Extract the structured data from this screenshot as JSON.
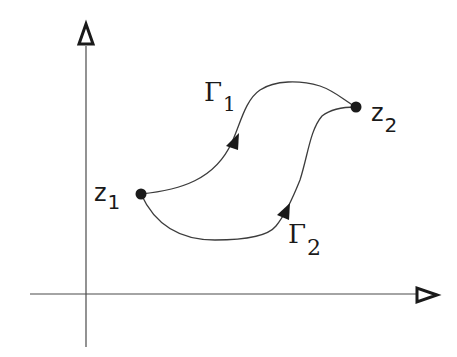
{
  "diagram": {
    "axes": {
      "x_axis": {
        "label": ""
      },
      "y_axis": {
        "label": ""
      }
    },
    "points": [
      {
        "id": "z1",
        "label_main": "z",
        "label_sub": "1"
      },
      {
        "id": "z2",
        "label_main": "z",
        "label_sub": "2"
      }
    ],
    "paths": [
      {
        "id": "Gamma1",
        "label_main": "Γ",
        "label_sub": "1",
        "from": "z1",
        "to": "z2",
        "direction": "z1 → z2 (upper path)"
      },
      {
        "id": "Gamma2",
        "label_main": "Γ",
        "label_sub": "2",
        "from": "z1",
        "to": "z2",
        "direction": "z1 → z2 (lower path)"
      }
    ],
    "colors": {
      "ink": "#1a1a1a",
      "background": "#ffffff"
    }
  }
}
